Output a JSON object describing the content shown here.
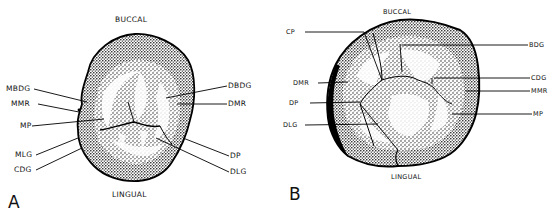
{
  "figure": {
    "panels": [
      {
        "id": "A",
        "letter": "A",
        "orientation": {
          "top": "BUCCAL",
          "bottom": "LINGUAL"
        },
        "labels_left": [
          "MBDG",
          "MMR",
          "MP",
          "MLG",
          "CDG"
        ],
        "labels_right": [
          "DBDG",
          "DMR",
          "DP",
          "DLG"
        ]
      },
      {
        "id": "B",
        "letter": "B",
        "orientation": {
          "top": "BUCCAL",
          "bottom": "LINGUAL"
        },
        "labels_left": [
          "CP",
          "DMR",
          "DP",
          "DLG"
        ],
        "labels_right": [
          "BDG",
          "CDG",
          "MMR",
          "MP"
        ]
      }
    ]
  }
}
